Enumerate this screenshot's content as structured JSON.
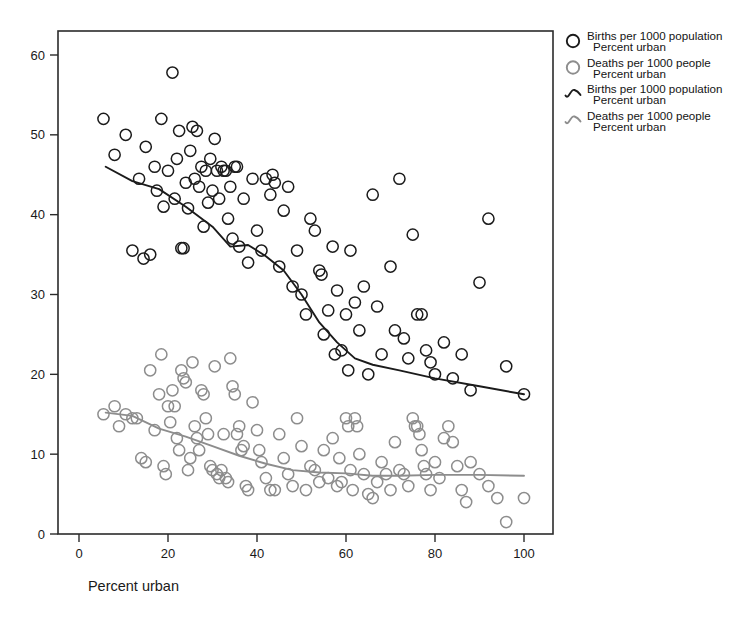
{
  "figure": {
    "background_color": "#ffffff",
    "frame_color": "#2b2b2b",
    "axis_label_color": "#1a1a1a"
  },
  "legend": {
    "position": "top-right",
    "entries": [
      {
        "marker": "circle-open-dark",
        "color": "#1b1b1b",
        "line1": "Births per 1000 population",
        "line2": "Percent urban"
      },
      {
        "marker": "circle-open-gray",
        "color": "#8d8d8d",
        "line1": "Deaths per 1000 people",
        "line2": "Percent urban"
      },
      {
        "marker": "fit-line-dark",
        "color": "#1b1b1b",
        "line1": "Births per 1000 population",
        "line2": "Percent urban"
      },
      {
        "marker": "fit-line-gray",
        "color": "#8d8d8d",
        "line1": "Deaths per 1000 people",
        "line2": "Percent urban"
      }
    ]
  },
  "chart_data": {
    "type": "scatter",
    "title": "",
    "subtitle": "",
    "xlabel": "Percent urban",
    "ylabel": "",
    "xlim": [
      -2,
      111
    ],
    "ylim": [
      -2.2,
      63.5
    ],
    "xticks": [
      0,
      20,
      40,
      60,
      80,
      100
    ],
    "yticks": [
      0,
      10,
      20,
      30,
      40,
      50,
      60
    ],
    "grid": false,
    "legend_position": "top-right",
    "annotations": [],
    "series": [
      {
        "name": "Births per 1000 population",
        "marker": "circle-open",
        "color": "#1b1b1b",
        "marker_size": 9,
        "points": [
          [
            5.5,
            52.0
          ],
          [
            8.0,
            47.5
          ],
          [
            10.5,
            50.0
          ],
          [
            12.0,
            35.5
          ],
          [
            13.5,
            44.5
          ],
          [
            14.5,
            34.5
          ],
          [
            15.0,
            48.5
          ],
          [
            16.0,
            35.0
          ],
          [
            17.0,
            46.0
          ],
          [
            17.5,
            43.0
          ],
          [
            18.5,
            52.0
          ],
          [
            19.0,
            41.0
          ],
          [
            20.0,
            45.5
          ],
          [
            21.0,
            57.8
          ],
          [
            21.5,
            42.0
          ],
          [
            22.0,
            47.0
          ],
          [
            22.5,
            50.5
          ],
          [
            23.0,
            35.8
          ],
          [
            23.5,
            35.8
          ],
          [
            24.0,
            44.0
          ],
          [
            24.5,
            40.8
          ],
          [
            25.0,
            48.0
          ],
          [
            25.5,
            51.0
          ],
          [
            26.0,
            44.5
          ],
          [
            26.5,
            50.5
          ],
          [
            27.0,
            43.5
          ],
          [
            27.5,
            46.0
          ],
          [
            28.0,
            38.5
          ],
          [
            28.5,
            45.5
          ],
          [
            29.0,
            41.5
          ],
          [
            29.5,
            47.0
          ],
          [
            30.0,
            43.0
          ],
          [
            30.5,
            49.5
          ],
          [
            31.0,
            45.5
          ],
          [
            31.5,
            42.0
          ],
          [
            32.0,
            46.0
          ],
          [
            32.5,
            45.5
          ],
          [
            33.0,
            45.5
          ],
          [
            33.5,
            39.5
          ],
          [
            34.0,
            43.5
          ],
          [
            34.5,
            37.0
          ],
          [
            35.0,
            46.0
          ],
          [
            35.5,
            46.0
          ],
          [
            36.0,
            36.0
          ],
          [
            37.0,
            42.0
          ],
          [
            38.0,
            34.0
          ],
          [
            39.0,
            44.5
          ],
          [
            40.0,
            38.0
          ],
          [
            41.0,
            35.5
          ],
          [
            42.0,
            44.5
          ],
          [
            43.0,
            42.5
          ],
          [
            43.5,
            45.0
          ],
          [
            44.0,
            44.0
          ],
          [
            45.0,
            33.5
          ],
          [
            46.0,
            40.5
          ],
          [
            47.0,
            43.5
          ],
          [
            48.0,
            31.0
          ],
          [
            49.0,
            35.5
          ],
          [
            50.0,
            30.0
          ],
          [
            51.0,
            27.5
          ],
          [
            52.0,
            39.5
          ],
          [
            53.0,
            38.0
          ],
          [
            54.0,
            33.0
          ],
          [
            54.5,
            32.5
          ],
          [
            55.0,
            25.0
          ],
          [
            56.0,
            28.0
          ],
          [
            57.0,
            36.0
          ],
          [
            57.5,
            22.5
          ],
          [
            58.0,
            30.5
          ],
          [
            59.0,
            23.0
          ],
          [
            60.0,
            27.5
          ],
          [
            60.5,
            20.5
          ],
          [
            61.0,
            35.5
          ],
          [
            62.0,
            29.0
          ],
          [
            63.0,
            25.5
          ],
          [
            64.0,
            31.0
          ],
          [
            65.0,
            20.0
          ],
          [
            66.0,
            42.5
          ],
          [
            67.0,
            28.5
          ],
          [
            68.0,
            22.5
          ],
          [
            70.0,
            33.5
          ],
          [
            71.0,
            25.5
          ],
          [
            72.0,
            44.5
          ],
          [
            73.0,
            24.5
          ],
          [
            74.0,
            22.0
          ],
          [
            75.0,
            37.5
          ],
          [
            76.0,
            27.5
          ],
          [
            77.0,
            27.5
          ],
          [
            78.0,
            23.0
          ],
          [
            79.0,
            21.5
          ],
          [
            80.0,
            20.0
          ],
          [
            82.0,
            24.0
          ],
          [
            84.0,
            19.5
          ],
          [
            86.0,
            22.5
          ],
          [
            88.0,
            18.0
          ],
          [
            90.0,
            31.5
          ],
          [
            92.0,
            39.5
          ],
          [
            96.0,
            21.0
          ],
          [
            100.0,
            17.5
          ]
        ],
        "fit_line": {
          "name": "lowess",
          "color": "#1b1b1b",
          "points": [
            [
              6.0,
              46.0
            ],
            [
              12.0,
              44.2
            ],
            [
              18.0,
              43.2
            ],
            [
              24.0,
              41.0
            ],
            [
              30.0,
              38.5
            ],
            [
              34.0,
              36.0
            ],
            [
              38.0,
              36.2
            ],
            [
              42.0,
              34.8
            ],
            [
              46.0,
              33.0
            ],
            [
              50.0,
              30.0
            ],
            [
              54.0,
              26.5
            ],
            [
              58.0,
              24.0
            ],
            [
              62.0,
              22.0
            ],
            [
              66.0,
              21.2
            ],
            [
              72.0,
              20.5
            ],
            [
              80.0,
              19.5
            ],
            [
              90.0,
              18.5
            ],
            [
              100.0,
              17.5
            ]
          ]
        }
      },
      {
        "name": "Deaths per 1000 people",
        "marker": "circle-open",
        "color": "#8d8d8d",
        "marker_size": 9,
        "points": [
          [
            5.5,
            15.0
          ],
          [
            8.0,
            16.0
          ],
          [
            9.0,
            13.5
          ],
          [
            10.5,
            15.0
          ],
          [
            12.0,
            14.5
          ],
          [
            13.0,
            14.5
          ],
          [
            14.0,
            9.5
          ],
          [
            15.0,
            9.0
          ],
          [
            16.0,
            20.5
          ],
          [
            17.0,
            13.0
          ],
          [
            18.0,
            17.5
          ],
          [
            18.5,
            22.5
          ],
          [
            19.0,
            8.5
          ],
          [
            19.5,
            7.5
          ],
          [
            20.0,
            16.0
          ],
          [
            20.5,
            14.0
          ],
          [
            21.0,
            18.0
          ],
          [
            21.5,
            16.0
          ],
          [
            22.0,
            12.0
          ],
          [
            22.5,
            10.5
          ],
          [
            23.0,
            20.5
          ],
          [
            23.5,
            19.5
          ],
          [
            24.0,
            19.0
          ],
          [
            24.5,
            8.0
          ],
          [
            25.0,
            9.5
          ],
          [
            25.5,
            21.5
          ],
          [
            26.0,
            13.5
          ],
          [
            26.5,
            12.0
          ],
          [
            27.0,
            10.5
          ],
          [
            27.5,
            18.0
          ],
          [
            28.0,
            17.5
          ],
          [
            28.5,
            14.5
          ],
          [
            29.0,
            12.5
          ],
          [
            29.5,
            8.5
          ],
          [
            30.0,
            8.0
          ],
          [
            30.5,
            21.0
          ],
          [
            31.0,
            7.5
          ],
          [
            31.5,
            7.0
          ],
          [
            32.0,
            8.0
          ],
          [
            32.5,
            12.5
          ],
          [
            33.0,
            7.0
          ],
          [
            33.5,
            6.5
          ],
          [
            34.0,
            22.0
          ],
          [
            34.5,
            18.5
          ],
          [
            35.0,
            17.5
          ],
          [
            35.5,
            12.5
          ],
          [
            36.0,
            13.5
          ],
          [
            36.5,
            10.5
          ],
          [
            37.0,
            11.0
          ],
          [
            37.5,
            6.0
          ],
          [
            38.0,
            5.5
          ],
          [
            39.0,
            16.5
          ],
          [
            40.0,
            13.0
          ],
          [
            40.5,
            10.5
          ],
          [
            41.0,
            9.0
          ],
          [
            42.0,
            7.0
          ],
          [
            43.0,
            5.5
          ],
          [
            44.0,
            5.5
          ],
          [
            45.0,
            12.5
          ],
          [
            46.0,
            9.5
          ],
          [
            47.0,
            7.5
          ],
          [
            48.0,
            6.0
          ],
          [
            49.0,
            14.5
          ],
          [
            50.0,
            11.0
          ],
          [
            51.0,
            5.5
          ],
          [
            52.0,
            8.5
          ],
          [
            53.0,
            8.0
          ],
          [
            54.0,
            6.5
          ],
          [
            55.0,
            10.5
          ],
          [
            56.0,
            7.0
          ],
          [
            57.0,
            12.0
          ],
          [
            58.0,
            6.0
          ],
          [
            58.5,
            9.5
          ],
          [
            59.0,
            6.5
          ],
          [
            60.0,
            14.5
          ],
          [
            60.5,
            13.5
          ],
          [
            61.0,
            8.0
          ],
          [
            61.5,
            5.5
          ],
          [
            62.0,
            14.5
          ],
          [
            62.5,
            13.5
          ],
          [
            63.0,
            10.0
          ],
          [
            64.0,
            7.5
          ],
          [
            65.0,
            5.0
          ],
          [
            66.0,
            4.5
          ],
          [
            67.0,
            6.5
          ],
          [
            68.0,
            9.0
          ],
          [
            69.0,
            7.5
          ],
          [
            70.0,
            5.5
          ],
          [
            71.0,
            11.5
          ],
          [
            72.0,
            8.0
          ],
          [
            73.0,
            7.5
          ],
          [
            74.0,
            6.0
          ],
          [
            75.0,
            14.5
          ],
          [
            75.5,
            13.5
          ],
          [
            76.0,
            13.5
          ],
          [
            76.5,
            12.5
          ],
          [
            77.0,
            10.5
          ],
          [
            77.5,
            8.5
          ],
          [
            78.0,
            7.5
          ],
          [
            79.0,
            5.5
          ],
          [
            80.0,
            9.0
          ],
          [
            81.0,
            7.0
          ],
          [
            82.0,
            12.0
          ],
          [
            83.0,
            13.5
          ],
          [
            84.0,
            11.5
          ],
          [
            85.0,
            8.5
          ],
          [
            86.0,
            5.5
          ],
          [
            87.0,
            4.0
          ],
          [
            88.0,
            9.0
          ],
          [
            90.0,
            7.5
          ],
          [
            92.0,
            6.0
          ],
          [
            94.0,
            4.5
          ],
          [
            96.0,
            1.5
          ],
          [
            100.0,
            4.5
          ]
        ],
        "fit_line": {
          "name": "lowess",
          "color": "#8d8d8d",
          "points": [
            [
              6.0,
              15.2
            ],
            [
              12.0,
              14.8
            ],
            [
              18.0,
              13.2
            ],
            [
              24.0,
              12.2
            ],
            [
              30.0,
              11.0
            ],
            [
              36.0,
              9.8
            ],
            [
              42.0,
              8.8
            ],
            [
              48.0,
              8.0
            ],
            [
              54.0,
              7.7
            ],
            [
              60.0,
              7.6
            ],
            [
              66.0,
              7.3
            ],
            [
              72.0,
              7.3
            ],
            [
              80.0,
              7.4
            ],
            [
              90.0,
              7.4
            ],
            [
              100.0,
              7.3
            ]
          ]
        }
      }
    ]
  }
}
